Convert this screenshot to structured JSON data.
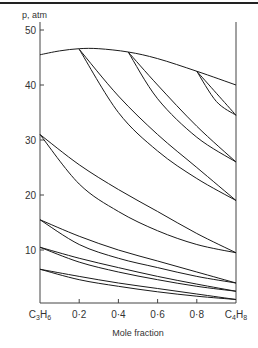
{
  "chart_data": {
    "type": "line",
    "title": "",
    "xlabel": "Mole fraction",
    "ylabel": "p, atm",
    "xlim": [
      0,
      1
    ],
    "ylim": [
      0,
      52
    ],
    "grid": false,
    "x_tick_labels": [
      "C3H6",
      "0·2",
      "0·4",
      "0·6",
      "0·8",
      "C4H8"
    ],
    "x_ticks": [
      0,
      0.2,
      0.4,
      0.6,
      0.8,
      1.0
    ],
    "y_ticks": [
      10,
      20,
      30,
      40,
      50
    ],
    "y_tick_labels": [
      "10",
      "20",
      "30",
      "40",
      "50"
    ],
    "series": [
      {
        "name": "critical-locus",
        "x": [
          0,
          0.1,
          0.2,
          0.3,
          0.45,
          0.6,
          0.8,
          1.0
        ],
        "y": [
          45.5,
          46.2,
          46.6,
          46.6,
          46.0,
          44.8,
          42.5,
          40.0
        ]
      },
      {
        "name": "loop-a-upper",
        "x": [
          0.2,
          0.4,
          0.6,
          0.8,
          1.0
        ],
        "y": [
          46.5,
          38.0,
          31.0,
          25.0,
          19.0
        ]
      },
      {
        "name": "loop-a-lower",
        "x": [
          0.2,
          0.4,
          0.6,
          0.8,
          1.0
        ],
        "y": [
          46.5,
          35.0,
          28.0,
          23.0,
          19.0
        ]
      },
      {
        "name": "loop-b-upper",
        "x": [
          0.45,
          0.6,
          0.8,
          1.0
        ],
        "y": [
          46.0,
          40.0,
          32.5,
          26.0
        ]
      },
      {
        "name": "loop-b-lower",
        "x": [
          0.45,
          0.6,
          0.8,
          1.0
        ],
        "y": [
          46.0,
          37.5,
          30.5,
          26.0
        ]
      },
      {
        "name": "loop-c-upper",
        "x": [
          0.8,
          0.9,
          1.0
        ],
        "y": [
          42.5,
          38.5,
          34.5
        ]
      },
      {
        "name": "loop-c-lower",
        "x": [
          0.8,
          0.9,
          1.0
        ],
        "y": [
          42.5,
          37.0,
          34.5
        ]
      },
      {
        "name": "loop-31-upper",
        "x": [
          0,
          0.2,
          0.4,
          0.6,
          0.8,
          1.0
        ],
        "y": [
          31.0,
          25.5,
          21.0,
          17.0,
          13.0,
          9.5
        ]
      },
      {
        "name": "loop-31-lower",
        "x": [
          0,
          0.2,
          0.4,
          0.6,
          0.8,
          1.0
        ],
        "y": [
          31.0,
          22.0,
          17.0,
          13.5,
          11.0,
          9.5
        ]
      },
      {
        "name": "loop-15-upper",
        "x": [
          0,
          0.2,
          0.4,
          0.6,
          0.8,
          1.0
        ],
        "y": [
          15.5,
          12.5,
          10.0,
          8.0,
          6.0,
          4.0
        ]
      },
      {
        "name": "loop-15-lower",
        "x": [
          0,
          0.2,
          0.4,
          0.6,
          0.8,
          1.0
        ],
        "y": [
          15.5,
          11.0,
          8.5,
          6.8,
          5.2,
          4.0
        ]
      },
      {
        "name": "loop-10-upper",
        "x": [
          0,
          0.2,
          0.4,
          0.6,
          0.8,
          1.0
        ],
        "y": [
          10.5,
          8.5,
          6.8,
          5.2,
          3.8,
          2.5
        ]
      },
      {
        "name": "loop-10-lower",
        "x": [
          0,
          0.2,
          0.4,
          0.6,
          0.8,
          1.0
        ],
        "y": [
          10.5,
          7.8,
          6.0,
          4.6,
          3.4,
          2.5
        ]
      },
      {
        "name": "loop-6-upper",
        "x": [
          0,
          0.2,
          0.4,
          0.6,
          0.8,
          1.0
        ],
        "y": [
          6.5,
          5.2,
          4.0,
          3.0,
          2.0,
          1.0
        ]
      },
      {
        "name": "loop-6-lower",
        "x": [
          0,
          0.2,
          0.4,
          0.6,
          0.8,
          1.0
        ],
        "y": [
          6.5,
          4.6,
          3.4,
          2.4,
          1.6,
          1.0
        ]
      }
    ]
  },
  "layout": {
    "x0": 40,
    "x1": 236,
    "y_zero": 305,
    "px_per_atm": 5.5
  }
}
